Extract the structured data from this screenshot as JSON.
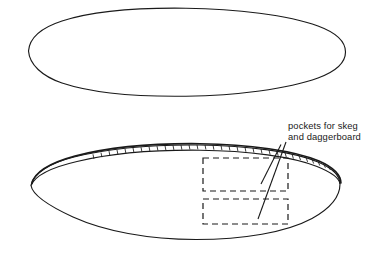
{
  "document": {
    "kind": "technical-line-drawing",
    "subject": "kayak hull plan and profile views"
  },
  "annotations": {
    "pockets_label": {
      "line1": "pockets for skeg",
      "line2": "and daggerboard"
    }
  },
  "views": {
    "top": {
      "name": "plan-view-hull-outline"
    },
    "bottom": {
      "name": "profile-view-hull-outline"
    }
  },
  "pockets": [
    {
      "name": "skeg-pocket-upper"
    },
    {
      "name": "daggerboard-pocket-lower"
    }
  ],
  "colors": {
    "stroke": "#1a1a1a",
    "background": "#ffffff",
    "text": "#1a1a1a"
  }
}
